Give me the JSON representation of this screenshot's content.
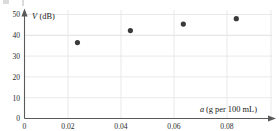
{
  "chart_data": {
    "type": "scatter",
    "title": "",
    "subtitle": "",
    "xlabel": "a (g per 100 mL)",
    "xlabel_variable": "a",
    "xlabel_units": "(g per 100 mL)",
    "ylabel": "V (dB)",
    "ylabel_variable": "V",
    "ylabel_units": "(dB)",
    "xlim": [
      0,
      0.095
    ],
    "ylim": [
      0,
      50
    ],
    "xticks": [
      0,
      0.02,
      0.04,
      0.06,
      0.08
    ],
    "xticklabels": [
      "0",
      "0.02",
      "0.04",
      "0.06",
      "0.08"
    ],
    "yticks": [
      0,
      10,
      20,
      30,
      40,
      50
    ],
    "yticklabels": [
      "0",
      "10",
      "20",
      "30",
      "40",
      "50"
    ],
    "grid": true,
    "grid_color": "#e6e6e6",
    "legend": false,
    "legend_position": "none",
    "marker_color": "#3a3a3a",
    "axis_color": "#5a5a5a",
    "x": [
      0.02,
      0.04,
      0.06,
      0.08
    ],
    "y": [
      35,
      40.5,
      43.5,
      46
    ],
    "points": [
      {
        "x": 0.02,
        "y": 35
      },
      {
        "x": 0.04,
        "y": 40.5
      },
      {
        "x": 0.06,
        "y": 43.5
      },
      {
        "x": 0.08,
        "y": 46
      }
    ],
    "series": [
      {
        "name": "V vs a",
        "x": [
          0.02,
          0.04,
          0.06,
          0.08
        ],
        "values": [
          35,
          40.5,
          43.5,
          46
        ]
      }
    ]
  },
  "ticks": {
    "y": {
      "t50": "50",
      "t40": "40",
      "t30": "30",
      "t20": "20",
      "t10": "10",
      "t0": "0"
    },
    "x": {
      "t0": "0",
      "t002": "0.02",
      "t004": "0.04",
      "t006": "0.06",
      "t008": "0.08"
    }
  },
  "labels": {
    "y_axis_var": "V",
    "y_axis_units": "(dB)",
    "x_axis_var": "a",
    "x_axis_units": "(g per 100 mL)"
  }
}
